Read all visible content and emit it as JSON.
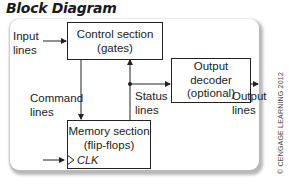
{
  "title": "Block Diagram",
  "blocks": {
    "control": {
      "line1": "Control section",
      "line2": "(gates)"
    },
    "memory": {
      "line1": "Memory section",
      "line2": "(flip-flops)",
      "clock_label": "CLK"
    },
    "output_decoder": {
      "line1": "Output",
      "line2": "decoder",
      "line3": "(optional)"
    }
  },
  "signals": {
    "input": {
      "line1": "Input",
      "line2": "lines"
    },
    "command": {
      "line1": "Command",
      "line2": "lines"
    },
    "status": {
      "line1": "Status",
      "line2": "lines"
    },
    "output": {
      "line1": "Output",
      "line2": "lines"
    }
  },
  "credit": "© CENGAGE LEARNING 2012",
  "colors": {
    "line": "#222222",
    "panel_shadow": "#b8b8b8",
    "background": "#ffffff"
  }
}
